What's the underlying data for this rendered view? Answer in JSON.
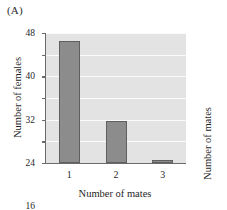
{
  "figure": {
    "panel_a_label": "(A)",
    "panel_b_label": "(B)"
  },
  "panel_b": {
    "ylabel": "Number of mates"
  },
  "chart_data": {
    "type": "bar",
    "title": "",
    "subtitle": "",
    "categories": [
      "1",
      "2",
      "3"
    ],
    "values": [
      45,
      15.5,
      1
    ],
    "xlabel": "Number of mates",
    "ylabel": "Number of females",
    "ylim": [
      0,
      48
    ],
    "yticks": [
      0,
      8,
      16,
      24,
      32,
      40,
      48
    ],
    "ytick_labels": [
      "0",
      "8",
      "16",
      "24",
      "32",
      "40",
      "48"
    ],
    "grid": true,
    "grid_color": "#fbfbfb",
    "legend": null,
    "legend_position": "none",
    "bar_color": "#8c8c8c",
    "bar_edge_color": "#5f5f5f",
    "plot_background": "#e3e3e3",
    "axis_color": "#6a6a6a"
  }
}
